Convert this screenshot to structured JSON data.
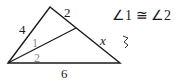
{
  "diagram": {
    "type": "triangle-angle-bisector",
    "side_labels": {
      "left_upper": "4",
      "top_right": "2",
      "right_lower": "x",
      "bottom": "6"
    },
    "angle_labels": {
      "upper": "1",
      "lower": "2"
    },
    "given": "∠1 ≅ ∠2",
    "mark": "ʒ",
    "colors": {
      "stroke": "#1a1a1a",
      "angle_label": "#8a8a8a"
    }
  }
}
